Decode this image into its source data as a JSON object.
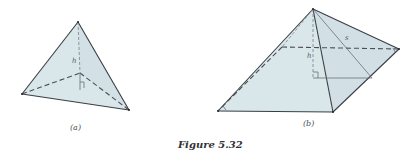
{
  "figure": {
    "caption": "Figure 5.32",
    "fill_color": "#d9e6ea",
    "fill_shadow_color": "#cfdde2",
    "edge_color": "#3a3f44"
  },
  "panel_a": {
    "label": "(a)",
    "shape": "triangular pyramid (tetrahedron)",
    "height_label": "h",
    "vertices": {
      "apex": [
        78,
        22
      ],
      "left": [
        22,
        94
      ],
      "right": [
        129,
        110
      ],
      "base_center": [
        80,
        73
      ]
    }
  },
  "panel_b": {
    "label": "(b)",
    "shape": "square pyramid",
    "height_label": "h",
    "slant_label": "s",
    "vertices": {
      "apex": [
        313,
        9
      ],
      "back_left": [
        282,
        47
      ],
      "back_right": [
        399,
        49
      ],
      "front_left": [
        218,
        111
      ],
      "front_right": [
        333,
        112
      ],
      "foot_of_height": [
        313,
        78
      ],
      "slant_foot": [
        372,
        78
      ]
    }
  }
}
